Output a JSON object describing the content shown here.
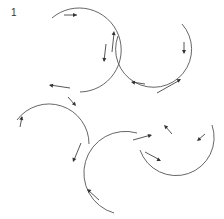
{
  "figure": {
    "label": "1",
    "line_color": "#555555",
    "background": "#ffffff"
  },
  "arcs": [
    {
      "name": "top-left",
      "d": "M 52 18 A 42 42 0 1 1 80 92"
    },
    {
      "name": "top-right",
      "d": "M 182 24 A 38 38 0 1 1 118 36"
    },
    {
      "name": "right",
      "d": "M 212 125 A 38 38 0 0 1 140 150"
    },
    {
      "name": "left",
      "d": "M 17 120 A 40 40 0 0 1 89 144"
    },
    {
      "name": "bottom",
      "d": "M 114 213 A 40 40 0 0 1 137 133"
    }
  ],
  "arrows": [
    {
      "d": "M 64 15 L 77 15",
      "hx": 77,
      "hy": 15,
      "angle": 0
    },
    {
      "d": "M 106 44 L 104 61",
      "hx": 104,
      "hy": 62,
      "angle": 95
    },
    {
      "d": "M 112 52 L 114 33",
      "hx": 114,
      "hy": 31,
      "angle": -85
    },
    {
      "d": "M 70 88 L 50 85",
      "hx": 49,
      "hy": 85,
      "angle": 190
    },
    {
      "d": "M 68 97 L 75 105",
      "hx": 76,
      "hy": 106,
      "angle": 50
    },
    {
      "d": "M 20 127 L 22 117",
      "hx": 22,
      "hy": 116,
      "angle": -80
    },
    {
      "d": "M 145 84 L 132 82",
      "hx": 131,
      "hy": 82,
      "angle": 190
    },
    {
      "d": "M 157 93 L 180 80",
      "hx": 181,
      "hy": 79,
      "angle": -30
    },
    {
      "d": "M 184 42 L 184 53",
      "hx": 184,
      "hy": 54,
      "angle": 90
    },
    {
      "d": "M 172 134 L 165 126",
      "hx": 164,
      "hy": 125,
      "angle": 225
    },
    {
      "d": "M 205 134 L 198 140",
      "hx": 197,
      "hy": 141,
      "angle": 140
    },
    {
      "d": "M 145 152 L 160 160",
      "hx": 161,
      "hy": 161,
      "angle": 25
    },
    {
      "d": "M 133 140 L 151 135",
      "hx": 152,
      "hy": 135,
      "angle": -15
    },
    {
      "d": "M 81 143 L 74 160",
      "hx": 73,
      "hy": 162,
      "angle": 110
    },
    {
      "d": "M 99 200 L 88 190",
      "hx": 87,
      "hy": 189,
      "angle": 220
    }
  ]
}
